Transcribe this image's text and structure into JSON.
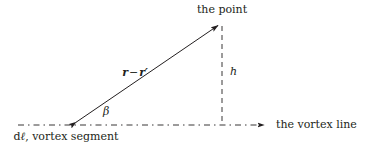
{
  "figure": {
    "width": 365,
    "height": 149,
    "background_color": "#ffffff",
    "ink_color": "#231f20"
  },
  "labels": {
    "point": "the point",
    "vortex_line": "the vortex line",
    "segment": "dℓ, vortex segment",
    "segment_differential": "d",
    "segment_ell": "ℓ",
    "segment_rest": ", vortex segment",
    "height": "h",
    "angle": "β",
    "vector_r": "r",
    "vector_minus": "−",
    "vector_r_prime": "r′",
    "vector_full": "r − r′"
  },
  "geometry": {
    "origin": {
      "x": 72,
      "y": 125
    },
    "point": {
      "x": 222,
      "y": 23
    },
    "foot": {
      "x": 222,
      "y": 125
    },
    "baseline_start": {
      "x": 18,
      "y": 125
    },
    "baseline_end": {
      "x": 270,
      "y": 125
    },
    "vector_arrow": {
      "x1": 72,
      "y1": 125,
      "x2": 222,
      "y2": 23
    },
    "height_line": {
      "x1": 222,
      "y1": 25,
      "x2": 222,
      "y2": 125
    },
    "baseline_style": "dash-dot",
    "height_line_style": "dashed",
    "vector_style": "solid double-arrow"
  },
  "strokes": {
    "solid_width": 1.0,
    "dashed_width": 0.9,
    "dash_pattern": "5 4",
    "dashdot_pattern": "6 4 1.5 4"
  }
}
